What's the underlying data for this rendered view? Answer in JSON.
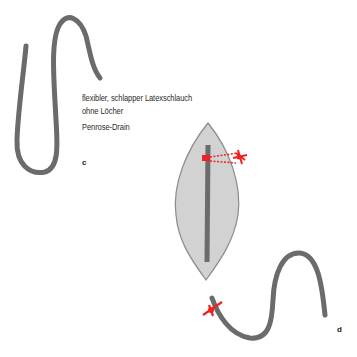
{
  "figure": {
    "description_lines": [
      "flexibler, schlapper Latexschlauch",
      "ohne Löcher"
    ],
    "name": "Penrose-Drain",
    "panels": [
      {
        "letter": "c"
      },
      {
        "letter": "d"
      }
    ]
  },
  "colors": {
    "tube": "#6b6b6b",
    "wound": "#cfcfcf",
    "wound_edge": "#8a8a8a",
    "suture": "#ee2222",
    "text": "#2b2b2b"
  }
}
